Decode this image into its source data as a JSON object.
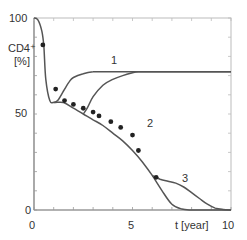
{
  "chart_data": {
    "type": "line",
    "title": "",
    "xlabel": "t [year]",
    "ylabel": "CD4+ [%]",
    "ylabel_lines": [
      "CD4⁺",
      "[%]"
    ],
    "xlim": [
      0,
      10
    ],
    "ylim": [
      0,
      100
    ],
    "x_ticks": [
      0,
      5,
      10
    ],
    "y_ticks": [
      0,
      50,
      100
    ],
    "x_tick_labels": [
      "0",
      "5",
      "10"
    ],
    "y_tick_labels": [
      "0",
      "50",
      "100"
    ],
    "minor_x_step": 1,
    "minor_y_step": 10,
    "grid": false,
    "legend": "none (curves labeled inline 1, 2, 3)",
    "series": [
      {
        "name": "baseline",
        "label": "",
        "x": [
          0,
          0.2,
          0.4,
          0.5,
          0.6,
          0.8,
          1.0,
          1.5,
          2,
          2.5,
          3,
          3.5,
          4,
          4.5,
          5,
          5.5,
          6,
          6.5,
          7,
          7.5,
          8,
          8.5,
          9,
          10
        ],
        "y": [
          100,
          99,
          93,
          85,
          68,
          57,
          56,
          56,
          53,
          50,
          47,
          44,
          40,
          36,
          31,
          25,
          18,
          10,
          3,
          0.5,
          0,
          0,
          0,
          0
        ]
      },
      {
        "name": "curve-1",
        "label": "1",
        "x": [
          1.0,
          1.2,
          1.5,
          1.8,
          2.0,
          2.5,
          3.0,
          3.5,
          4,
          5,
          6,
          7,
          8,
          9,
          10
        ],
        "y": [
          56,
          57,
          62,
          67,
          69,
          71,
          72,
          72,
          72,
          72,
          72,
          72,
          72,
          72,
          72
        ]
      },
      {
        "name": "curve-2",
        "label": "2",
        "x": [
          2.5,
          2.7,
          3.0,
          3.5,
          4.0,
          4.5,
          5.0,
          5.3,
          5.7,
          6.0,
          6.5,
          7.0,
          8,
          9,
          10
        ],
        "y": [
          50,
          53,
          59,
          65,
          68,
          70,
          71.5,
          72,
          72,
          72,
          72,
          72,
          72,
          72,
          72
        ]
      },
      {
        "name": "curve-3",
        "label": "3",
        "x": [
          6.0,
          6.4,
          6.8,
          7.2,
          7.6,
          8.0,
          8.4,
          8.8,
          9.2,
          9.6,
          10
        ],
        "y": [
          18,
          16,
          15,
          14,
          12,
          9,
          6,
          3,
          1,
          0.3,
          0
        ]
      },
      {
        "name": "measured",
        "type": "scatter",
        "x": [
          0.45,
          1.1,
          1.55,
          2.0,
          2.5,
          3.0,
          3.3,
          3.9,
          4.4,
          5.0,
          5.3,
          6.2
        ],
        "y": [
          86,
          63,
          57,
          55,
          53,
          51,
          49,
          46,
          43,
          39,
          31,
          17
        ]
      }
    ],
    "annotations": [
      {
        "text": "1",
        "x": 4.3,
        "y": 76
      },
      {
        "text": "2",
        "x": 6.0,
        "y": 45
      },
      {
        "text": "3",
        "x": 7.8,
        "y": 20
      }
    ]
  },
  "labels": {
    "y100": "100",
    "y50": "50",
    "y0": "0",
    "x0": "0",
    "x5": "5",
    "x10": "10",
    "xlabel": "t [year]",
    "ylabel_line1": "CD4⁺",
    "ylabel_line2": "[%]",
    "curve1": "1",
    "curve2": "2",
    "curve3": "3"
  },
  "style": {
    "line_color": "#555555",
    "axis_color": "#888888",
    "marker_color": "#222222",
    "background": "#ffffff"
  }
}
